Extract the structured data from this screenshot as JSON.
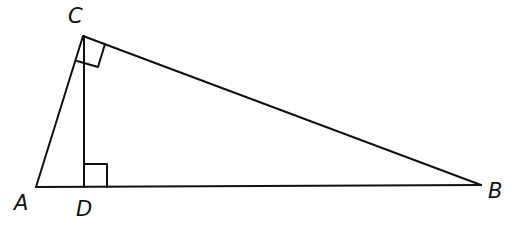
{
  "diagram": {
    "type": "right triangle with altitude",
    "vertices": {
      "A": {
        "label": "A",
        "x": 36,
        "y": 187
      },
      "B": {
        "label": "B",
        "x": 481,
        "y": 185
      },
      "C": {
        "label": "C",
        "x": 83,
        "y": 36
      },
      "D": {
        "label": "D",
        "x": 84,
        "y": 187
      }
    },
    "segments": [
      "AB",
      "BC",
      "CA",
      "CD"
    ],
    "right_angles": [
      "ACB",
      "CDB"
    ],
    "stroke_color": "#111111"
  }
}
